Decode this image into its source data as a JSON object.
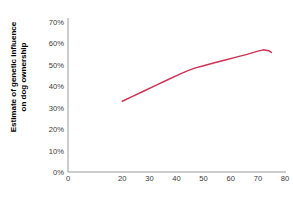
{
  "chart_data": {
    "type": "line",
    "title": "",
    "subtitle": "",
    "xlabel": "Age of twins",
    "ylabel": "Estimate of genetic influence on dog ownership",
    "ylabel_line1": "Estimate of genetic influence",
    "ylabel_line2": "on dog ownership",
    "xlim": [
      0,
      80
    ],
    "ylim": [
      0,
      70
    ],
    "xticks": [
      0,
      20,
      30,
      40,
      50,
      60,
      70,
      80
    ],
    "xtick_labels": [
      "0",
      "20",
      "30",
      "40",
      "50",
      "60",
      "70",
      "80"
    ],
    "yticks": [
      0,
      10,
      20,
      30,
      40,
      50,
      60,
      70
    ],
    "ytick_labels": [
      "0%",
      "10%",
      "20%",
      "30%",
      "40%",
      "50%",
      "60%",
      "70%"
    ],
    "grid": false,
    "legend": false,
    "legend_position": "none",
    "line_color": "#CC3355",
    "axis_color": "#9a9a9a",
    "background_color": "#FFFFFF",
    "series": [
      {
        "name": "Estimate of genetic influence on dog ownership",
        "x": [
          20,
          24,
          28,
          32,
          36,
          40,
          44,
          47,
          50,
          54,
          58,
          62,
          66,
          70,
          72,
          74,
          75
        ],
        "values": [
          33.0,
          35.4,
          37.8,
          40.2,
          42.6,
          45.0,
          47.2,
          48.6,
          49.6,
          51.0,
          52.3,
          53.6,
          54.9,
          56.4,
          57.0,
          56.6,
          55.8
        ]
      }
    ],
    "annotations": []
  },
  "figure": {
    "x_axis_title": "Age of twins",
    "y_axis_title_line1": "Estimate of genetic influence",
    "y_axis_title_line2": "on dog ownership"
  }
}
